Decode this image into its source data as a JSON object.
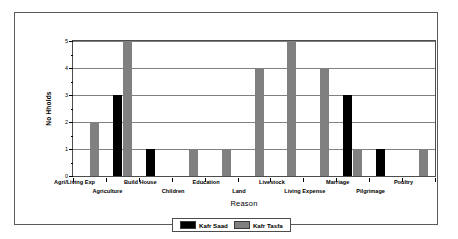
{
  "chart_data": {
    "type": "bar",
    "title": "",
    "xlabel": "Reason",
    "ylabel": "No Hholds",
    "ylim": [
      0,
      5
    ],
    "yticks": [
      0,
      1,
      2,
      3,
      4,
      5
    ],
    "ytick_labels": [
      "0",
      "1",
      "2",
      "3",
      "4",
      "5"
    ],
    "grid": true,
    "grid_axis": "y",
    "legend_position": "below-center",
    "categories": [
      "Agri/Living Exp",
      "Agriculture",
      "Build House",
      "Children",
      "Education",
      "Land",
      "Livestock",
      "Living Expense",
      "Marriage",
      "Pilgrimage",
      "Poultry"
    ],
    "series": [
      {
        "name": "Kafr Saad",
        "color": "#000000",
        "values": [
          0,
          3,
          1,
          0,
          0,
          0,
          0,
          0,
          3,
          1,
          0
        ]
      },
      {
        "name": "Kafr Tasfa",
        "color": "#808080",
        "values": [
          2,
          5,
          0,
          1,
          1,
          4,
          5,
          4,
          1,
          0,
          1
        ]
      }
    ]
  },
  "legend": {
    "entries": [
      {
        "label": "Kafr Saad",
        "color": "#000000"
      },
      {
        "label": "Kafr Tasfa",
        "color": "#808080"
      }
    ]
  },
  "colors": {
    "series_black": "#000000",
    "series_gray": "#808080",
    "axis": "#4d4d4d",
    "grid": "#808080",
    "frame": "#5a5a5a",
    "shadow": "#b9b9b9",
    "background": "#ffffff"
  }
}
